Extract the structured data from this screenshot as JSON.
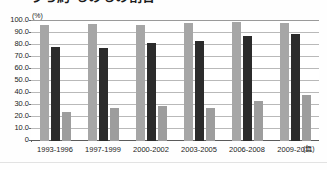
{
  "chart_data": {
    "type": "bar",
    "title": "うち約 ものもの割合",
    "title_note": "title is cropped at the top edge of the screenshot; only the lower strokes of the Japanese heading are visible",
    "subtitle": "",
    "xlabel": "(年)",
    "ylabel": "(%)",
    "ylim": [
      0,
      100
    ],
    "ytick_step": 10,
    "grid": true,
    "legend_position": "none",
    "categories": [
      "1993-1996",
      "1997-1999",
      "2000-2002",
      "2003-2005",
      "2006-2008",
      "2009-2011"
    ],
    "ytick_labels": [
      "100.0",
      "90.0",
      "80.0",
      "70.0",
      "60.0",
      "50.0",
      "40.0",
      "30.0",
      "20.0",
      "10.0",
      "0"
    ],
    "series": [
      {
        "name": "series-1",
        "color": "#a6a6a6",
        "values": [
          96.3,
          97.3,
          96.8,
          98.0,
          98.8,
          98.5
        ]
      },
      {
        "name": "series-2",
        "color": "#2b2b2b",
        "values": [
          78.0,
          77.5,
          81.3,
          83.5,
          87.5,
          89.5
        ]
      },
      {
        "name": "series-3",
        "color": "#9d9d9d",
        "values": [
          24.5,
          27.2,
          28.8,
          27.5,
          33.3,
          38.7
        ]
      }
    ]
  },
  "axis": {
    "unit_y": "(%)",
    "unit_x": "(年)"
  }
}
